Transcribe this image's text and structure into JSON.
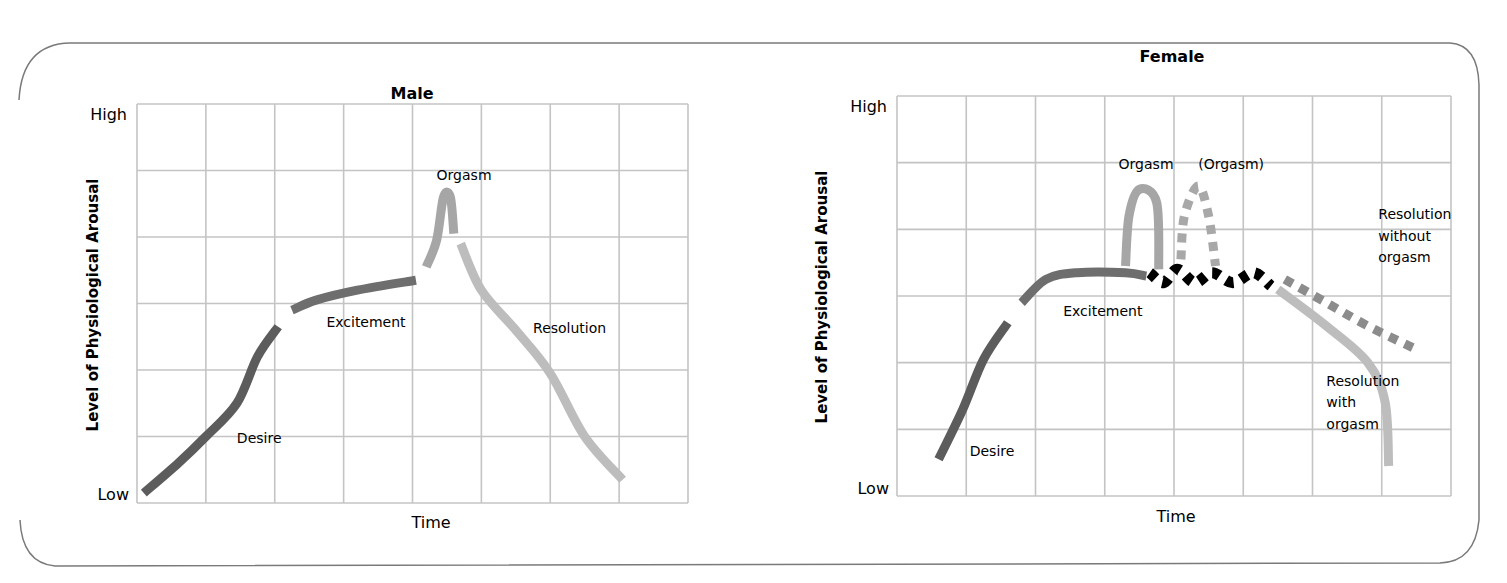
{
  "frame": {
    "border_color": "#7a7a7a",
    "grid_color": "#c4c4c4"
  },
  "colors": {
    "desire": "#5c5c5c",
    "excitement": "#6e6e6e",
    "orgasm": "#a6a6a6",
    "resolution": "#bdbdbd",
    "plateau_dots": "#000000",
    "dotted_gray": "#a8a8a8",
    "dotted_dark": "#8c8c8c"
  },
  "chart_data": [
    {
      "type": "line",
      "title": "Male",
      "xlabel": "Time",
      "ylabel": "Level of Physiological Arousal",
      "y_ticks": [
        "High",
        "Low"
      ],
      "grid": {
        "on": true,
        "columns": 8,
        "rows": 6
      },
      "xlim": [
        0,
        8
      ],
      "ylim": [
        0,
        6
      ],
      "plot_box": {
        "left": 137,
        "top": 104,
        "right": 688,
        "bottom": 503
      },
      "series": [
        {
          "name": "Desire",
          "style": "solid",
          "color_key": "desire",
          "points": [
            [
              0.1,
              0.15
            ],
            [
              0.6,
              0.6
            ],
            [
              1.0,
              1.0
            ],
            [
              1.45,
              1.5
            ],
            [
              1.75,
              2.2
            ],
            [
              2.05,
              2.65
            ]
          ]
        },
        {
          "name": "Excitement",
          "style": "solid",
          "color_key": "excitement",
          "points": [
            [
              2.25,
              2.9
            ],
            [
              2.6,
              3.05
            ],
            [
              3.2,
              3.2
            ],
            [
              4.05,
              3.35
            ]
          ]
        },
        {
          "name": "Orgasm",
          "style": "solid",
          "color_key": "orgasm",
          "points": [
            [
              4.2,
              3.55
            ],
            [
              4.35,
              3.95
            ],
            [
              4.45,
              4.6
            ],
            [
              4.55,
              4.6
            ],
            [
              4.6,
              4.05
            ]
          ]
        },
        {
          "name": "Resolution",
          "style": "solid",
          "color_key": "resolution",
          "points": [
            [
              4.7,
              3.9
            ],
            [
              5.0,
              3.2
            ],
            [
              5.5,
              2.6
            ],
            [
              6.0,
              1.95
            ],
            [
              6.5,
              1.0
            ],
            [
              7.05,
              0.35
            ]
          ]
        }
      ],
      "annotations": [
        {
          "text": "Orgasm",
          "x": 4.35,
          "y": 4.85
        },
        {
          "text": "Excitement",
          "x": 2.75,
          "y": 2.65
        },
        {
          "text": "Resolution",
          "x": 5.75,
          "y": 2.55
        },
        {
          "text": "Desire",
          "x": 1.45,
          "y": 0.9
        }
      ]
    },
    {
      "type": "line",
      "title": "Female",
      "xlabel": "Time",
      "ylabel": "Level of Physiological Arousal",
      "y_ticks": [
        "High",
        "Low"
      ],
      "grid": {
        "on": true,
        "columns": 8,
        "rows": 6
      },
      "xlim": [
        0,
        8
      ],
      "ylim": [
        0,
        6
      ],
      "plot_box": {
        "left": 897,
        "top": 96,
        "right": 1451,
        "bottom": 496
      },
      "series": [
        {
          "name": "Desire",
          "style": "solid",
          "color_key": "desire",
          "points": [
            [
              0.6,
              0.55
            ],
            [
              0.95,
              1.3
            ],
            [
              1.25,
              2.05
            ],
            [
              1.6,
              2.6
            ]
          ]
        },
        {
          "name": "Excitement",
          "style": "solid",
          "color_key": "excitement",
          "points": [
            [
              1.8,
              2.9
            ],
            [
              2.15,
              3.25
            ],
            [
              2.6,
              3.35
            ],
            [
              3.3,
              3.35
            ],
            [
              3.6,
              3.3
            ]
          ]
        },
        {
          "name": "Orgasm",
          "style": "solid",
          "color_key": "orgasm",
          "points": [
            [
              3.3,
              3.45
            ],
            [
              3.35,
              4.2
            ],
            [
              3.5,
              4.6
            ],
            [
              3.75,
              4.4
            ],
            [
              3.78,
              3.4
            ]
          ]
        },
        {
          "name": "(Orgasm)",
          "style": "dotted",
          "color_key": "dotted_gray",
          "points": [
            [
              4.1,
              3.55
            ],
            [
              4.15,
              4.2
            ],
            [
              4.35,
              4.65
            ],
            [
              4.5,
              4.2
            ],
            [
              4.6,
              3.45
            ]
          ]
        },
        {
          "name": "Plateau oscillation",
          "style": "dotted",
          "color_key": "plateau_dots",
          "points": [
            [
              3.65,
              3.35
            ],
            [
              3.85,
              3.2
            ],
            [
              4.05,
              3.4
            ],
            [
              4.3,
              3.2
            ],
            [
              4.55,
              3.35
            ],
            [
              4.85,
              3.2
            ],
            [
              5.15,
              3.35
            ],
            [
              5.4,
              3.15
            ]
          ]
        },
        {
          "name": "Resolution without orgasm",
          "style": "dotted",
          "color_key": "dotted_dark",
          "points": [
            [
              5.6,
              3.25
            ],
            [
              6.2,
              2.9
            ],
            [
              6.8,
              2.55
            ],
            [
              7.5,
              2.2
            ]
          ]
        },
        {
          "name": "Resolution with orgasm",
          "style": "solid",
          "color_key": "resolution",
          "points": [
            [
              5.5,
              3.1
            ],
            [
              6.2,
              2.55
            ],
            [
              6.8,
              2.0
            ],
            [
              7.05,
              1.4
            ],
            [
              7.1,
              0.45
            ]
          ]
        }
      ],
      "annotations": [
        {
          "text": "Orgasm",
          "x": 3.2,
          "y": 4.9
        },
        {
          "text": "(Orgasm)",
          "x": 4.35,
          "y": 4.9
        },
        {
          "text": "Resolution",
          "x": 6.95,
          "y": 4.15
        },
        {
          "text": "without",
          "x": 6.95,
          "y": 3.83
        },
        {
          "text": "orgasm",
          "x": 6.95,
          "y": 3.51
        },
        {
          "text": "Excitement",
          "x": 2.4,
          "y": 2.7
        },
        {
          "text": "Resolution",
          "x": 6.2,
          "y": 1.65
        },
        {
          "text": "with",
          "x": 6.2,
          "y": 1.33
        },
        {
          "text": "orgasm",
          "x": 6.2,
          "y": 1.01
        },
        {
          "text": "Desire",
          "x": 1.05,
          "y": 0.6
        }
      ]
    }
  ]
}
